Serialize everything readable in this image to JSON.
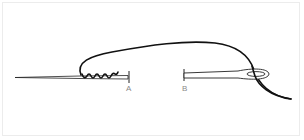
{
  "figure": {
    "labels": [
      {
        "id": "A",
        "text": "A"
      },
      {
        "id": "B",
        "text": "B"
      }
    ],
    "colors": {
      "background": "#ffffff",
      "frame": "#ececec",
      "stroke": "#111111",
      "label": "#8a8a8a"
    }
  }
}
